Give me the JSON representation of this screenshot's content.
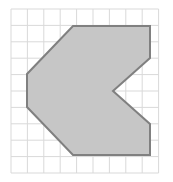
{
  "figure": {
    "canvas": {
      "width": 173,
      "height": 182,
      "background": "#ffffff"
    },
    "grid": {
      "origin_x": 11,
      "origin_y": 9,
      "cell_size": 16.4,
      "columns": 9,
      "rows": 10,
      "line_color": "#d9d9d9",
      "line_width": 1,
      "visible": true
    },
    "shape": {
      "name": "arrow-notched-hexagon",
      "fill_color": "#c6c6c6",
      "stroke_color": "#808080",
      "stroke_width": 2,
      "vertex_count": 9,
      "vertices_px": [
        [
          73,
          26
        ],
        [
          150,
          26
        ],
        [
          150,
          58
        ],
        [
          113,
          91
        ],
        [
          150,
          124
        ],
        [
          150,
          155
        ],
        [
          73,
          155
        ],
        [
          27,
          107
        ],
        [
          27,
          74
        ]
      ],
      "points_attr": "73,26 150,26 150,58 113,91 150,124 150,155 73,155 27,107 27,74"
    }
  }
}
